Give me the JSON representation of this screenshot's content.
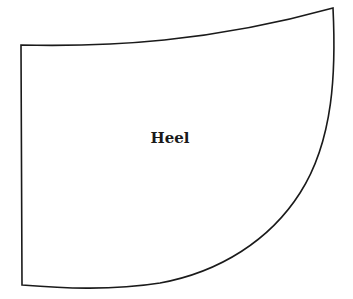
{
  "diagram": {
    "shape_label": "Heel",
    "stroke_color": "#1a1a1a",
    "fill_color": "#ffffff"
  }
}
